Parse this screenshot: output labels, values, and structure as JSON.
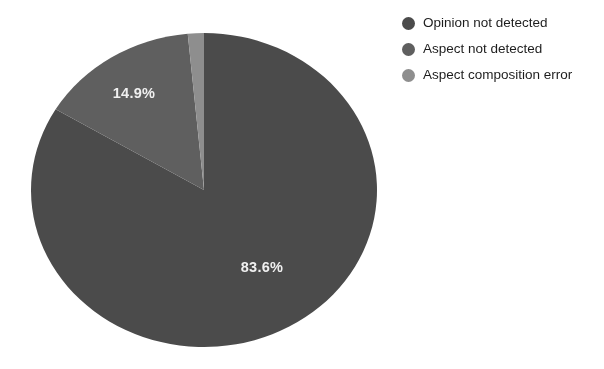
{
  "chart_data": {
    "type": "pie",
    "title": "",
    "subtitle": "",
    "xlabel": "",
    "ylabel": "",
    "grid": false,
    "legend_position": "right",
    "units": "percent",
    "start_angle_deg": 0,
    "direction": "clockwise",
    "categories": [
      "Opinion not detected",
      "Aspect not detected",
      "Aspect composition error"
    ],
    "values": [
      83.6,
      14.9,
      1.5
    ],
    "value_labels": [
      "83.6%",
      "14.9%",
      ""
    ],
    "colors": [
      "#4a4a4a",
      "#5e5e5e",
      "#8e8e8e"
    ],
    "slices": [
      {
        "label": "Opinion not detected",
        "value": 83.6,
        "display": "83.6%",
        "color": "#4a4a4a",
        "label_shown": true
      },
      {
        "label": "Aspect not detected",
        "value": 14.9,
        "display": "14.9%",
        "color": "#5e5e5e",
        "label_shown": true
      },
      {
        "label": "Aspect composition error",
        "value": 1.5,
        "display": "",
        "color": "#8e8e8e",
        "label_shown": false
      }
    ],
    "annotations": []
  },
  "pie": {
    "label_large": "83.6%",
    "label_medium": "14.9%"
  },
  "legend": {
    "items": [
      {
        "label": "Opinion not detected",
        "color": "#4a4a4a"
      },
      {
        "label": "Aspect not detected",
        "color": "#5e5e5e"
      },
      {
        "label": "Aspect composition error",
        "color": "#8e8e8e"
      }
    ]
  },
  "page": {
    "background": "#ffffff",
    "label_text_color": "#f2f2f2",
    "legend_text_color": "#1c1c1c"
  }
}
